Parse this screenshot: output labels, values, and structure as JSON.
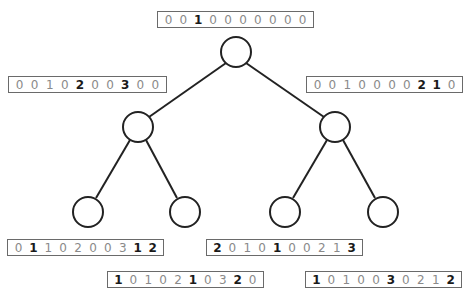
{
  "diagram": {
    "type": "binary-tree",
    "colors": {
      "stroke": "#222222",
      "box_border": "#6a6a6a",
      "digit_normal": "#8a8a8a",
      "digit_bold": "#1a1a1a"
    },
    "nodes": [
      {
        "id": "root",
        "cx": 236,
        "cy": 52
      },
      {
        "id": "left",
        "cx": 138,
        "cy": 127
      },
      {
        "id": "right",
        "cx": 335,
        "cy": 127
      },
      {
        "id": "leaf-1",
        "cx": 88,
        "cy": 212
      },
      {
        "id": "leaf-2",
        "cx": 185,
        "cy": 212
      },
      {
        "id": "leaf-3",
        "cx": 285,
        "cy": 212
      },
      {
        "id": "leaf-4",
        "cx": 383,
        "cy": 212
      }
    ],
    "vectors": [
      {
        "id": "vec-root",
        "x": 157,
        "y": 11,
        "w": 157,
        "values": [
          "0",
          "0",
          "1",
          "0",
          "0",
          "0",
          "0",
          "0",
          "0",
          "0"
        ],
        "bold": [
          2
        ]
      },
      {
        "id": "vec-left",
        "x": 8,
        "y": 76,
        "w": 159,
        "values": [
          "0",
          "0",
          "1",
          "0",
          "2",
          "0",
          "0",
          "3",
          "0",
          "0"
        ],
        "bold": [
          4,
          7
        ]
      },
      {
        "id": "vec-right",
        "x": 306,
        "y": 76,
        "w": 157,
        "values": [
          "0",
          "0",
          "1",
          "0",
          "0",
          "0",
          "0",
          "2",
          "1",
          "0"
        ],
        "bold": [
          7,
          8
        ]
      },
      {
        "id": "vec-leaf-1",
        "x": 7,
        "y": 239,
        "w": 157,
        "values": [
          "0",
          "1",
          "1",
          "0",
          "2",
          "0",
          "0",
          "3",
          "1",
          "2"
        ],
        "bold": [
          1,
          8,
          9
        ]
      },
      {
        "id": "vec-leaf-3",
        "x": 206,
        "y": 239,
        "w": 157,
        "values": [
          "2",
          "0",
          "1",
          "0",
          "1",
          "0",
          "0",
          "2",
          "1",
          "3"
        ],
        "bold": [
          0,
          4,
          9
        ]
      },
      {
        "id": "vec-leaf-2",
        "x": 107,
        "y": 271,
        "w": 157,
        "values": [
          "1",
          "0",
          "1",
          "0",
          "2",
          "1",
          "0",
          "3",
          "2",
          "0"
        ],
        "bold": [
          0,
          5,
          8
        ]
      },
      {
        "id": "vec-leaf-4",
        "x": 305,
        "y": 271,
        "w": 157,
        "values": [
          "1",
          "0",
          "1",
          "0",
          "0",
          "3",
          "0",
          "2",
          "1",
          "2"
        ],
        "bold": [
          0,
          5,
          9
        ]
      }
    ]
  }
}
